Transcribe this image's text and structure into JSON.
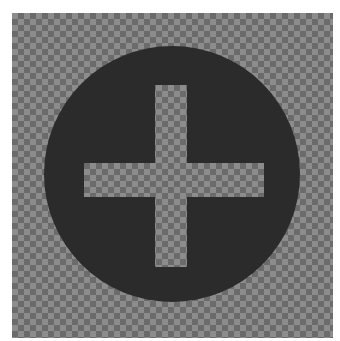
{
  "image": {
    "title": "Add icon on transparency checkerboard",
    "icon": "plus-circle-icon",
    "colors": {
      "background": "#ffffff",
      "checker_light": "#8c8c8c",
      "checker_dark": "#6b6b6b",
      "circle_fill": "#2b2b2b"
    },
    "checkerboard": {
      "x": 12,
      "y": 13,
      "width": 321,
      "height": 325,
      "square_size": 6
    },
    "circle": {
      "cx": 172,
      "cy": 174,
      "r": 128
    },
    "cross": {
      "vertical": {
        "x": 155,
        "y": 85,
        "width": 32,
        "height": 182
      },
      "horizontal": {
        "x": 84,
        "y": 163,
        "width": 180,
        "height": 34
      }
    }
  }
}
